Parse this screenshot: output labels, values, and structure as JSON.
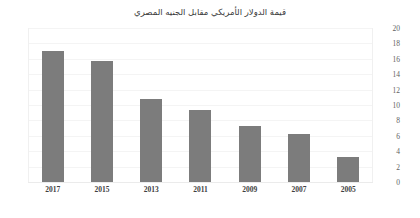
{
  "chart_data": {
    "type": "bar",
    "title": "قيمة الدولار الأمريكي مقابل الجنيه المصري",
    "xlabel": "",
    "ylabel": "",
    "categories": [
      "2017",
      "2015",
      "2013",
      "2011",
      "2009",
      "2007",
      "2005"
    ],
    "values": [
      17.0,
      15.7,
      10.8,
      9.4,
      7.3,
      6.3,
      3.3
    ],
    "ylim": [
      0,
      20
    ],
    "yticks": [
      "0",
      "2",
      "4",
      "6",
      "8",
      "10",
      "12",
      "14",
      "16",
      "18",
      "20"
    ],
    "ytick_values": [
      0,
      2,
      4,
      6,
      8,
      10,
      12,
      14,
      16,
      18,
      20
    ],
    "grid": true,
    "legend": false,
    "y_axis_position": "right",
    "bar_color": "#7c7c7c",
    "background_color": "#ffffff"
  }
}
